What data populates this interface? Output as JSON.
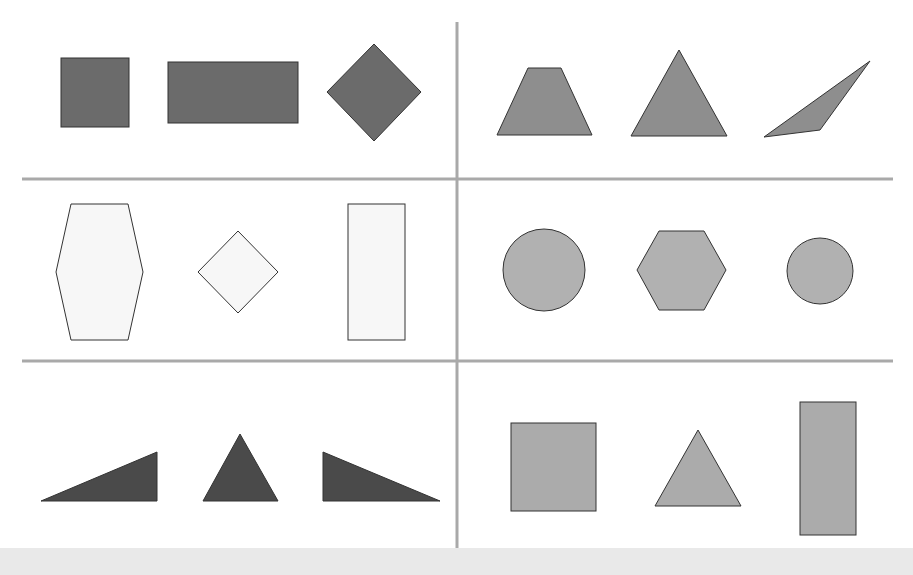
{
  "colors": {
    "background": "#ffffff",
    "divider": "#a9a9a9",
    "stroke": "#333333",
    "dark_gray": "#6b6b6b",
    "medium_gray": "#8e8e8e",
    "light_gray": "#b1b1b1",
    "white_fill": "#f7f7f7",
    "darkest": "#4a4a4a",
    "bottom_strip": "#e9e9e9"
  },
  "grid": {
    "rows": 3,
    "cols": 2,
    "cells": [
      {
        "id": "r1c1",
        "label": "dark gray quadrilaterals",
        "shapes": [
          "square",
          "rectangle",
          "diamond"
        ]
      },
      {
        "id": "r1c2",
        "label": "medium gray shapes",
        "shapes": [
          "trapezoid",
          "triangle",
          "obtuse-triangle"
        ]
      },
      {
        "id": "r2c1",
        "label": "white shapes",
        "shapes": [
          "hexagon",
          "diamond",
          "rectangle"
        ]
      },
      {
        "id": "r2c2",
        "label": "light gray rounded shapes",
        "shapes": [
          "circle",
          "hexagon",
          "circle"
        ]
      },
      {
        "id": "r3c1",
        "label": "black triangles",
        "shapes": [
          "right-triangle",
          "triangle",
          "right-triangle"
        ]
      },
      {
        "id": "r3c2",
        "label": "light gray shapes",
        "shapes": [
          "square",
          "triangle",
          "rectangle"
        ]
      }
    ]
  }
}
